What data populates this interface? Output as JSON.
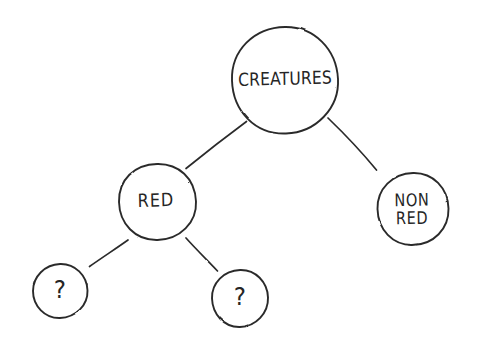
{
  "diagram": {
    "type": "hand-drawn-tree",
    "background_color": "#ffffff",
    "stroke_color": "#2b2b2b",
    "text_color": "#252525",
    "nodes": [
      {
        "id": "creatures",
        "label": "CREATURES",
        "shape": "circle",
        "cx": 285,
        "cy": 80,
        "r": 53,
        "level": 0
      },
      {
        "id": "red",
        "label": "RED",
        "shape": "circle",
        "cx": 157,
        "cy": 202,
        "r": 38,
        "level": 1
      },
      {
        "id": "non-red",
        "label": "NON\nRED",
        "shape": "circle",
        "cx": 413,
        "cy": 209,
        "r": 36,
        "level": 1
      },
      {
        "id": "unknown-left",
        "label": "?",
        "shape": "circle",
        "cx": 60,
        "cy": 291,
        "r": 27,
        "level": 2
      },
      {
        "id": "unknown-right",
        "label": "?",
        "shape": "circle",
        "cx": 240,
        "cy": 298,
        "r": 28,
        "level": 2
      }
    ],
    "edges": [
      {
        "id": "creatures-red",
        "from": "creatures",
        "to": "red",
        "x1": 246,
        "y1": 122,
        "x2": 186,
        "y2": 168
      },
      {
        "id": "creatures-non-red",
        "from": "creatures",
        "to": "non-red",
        "x1": 328,
        "y1": 118,
        "x2": 376,
        "y2": 170
      },
      {
        "id": "red-unknown-left",
        "from": "red",
        "to": "unknown-left",
        "x1": 128,
        "y1": 240,
        "x2": 90,
        "y2": 266
      },
      {
        "id": "red-unknown-right",
        "from": "red",
        "to": "unknown-right",
        "x1": 186,
        "y1": 238,
        "x2": 217,
        "y2": 271
      }
    ]
  }
}
